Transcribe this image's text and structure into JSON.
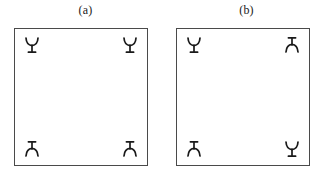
{
  "figure": {
    "background_color": "#ffffff",
    "stroke_color": "#4a4a4a",
    "glyph_color": "#1a1a1a",
    "panel_count": 2
  },
  "panels": [
    {
      "id": "panel-a",
      "label": "(a)",
      "symmetry": "horizontal-mirror",
      "corners": [
        {
          "position": "top-left",
          "glyph": "antenna-icon",
          "orientation": "up"
        },
        {
          "position": "top-right",
          "glyph": "antenna-icon",
          "orientation": "up"
        },
        {
          "position": "bottom-left",
          "glyph": "antenna-icon",
          "orientation": "down"
        },
        {
          "position": "bottom-right",
          "glyph": "antenna-icon",
          "orientation": "down"
        }
      ]
    },
    {
      "id": "panel-b",
      "label": "(b)",
      "symmetry": "diagonal-point",
      "corners": [
        {
          "position": "top-left",
          "glyph": "antenna-icon",
          "orientation": "up"
        },
        {
          "position": "top-right",
          "glyph": "antenna-icon",
          "orientation": "down"
        },
        {
          "position": "bottom-left",
          "glyph": "antenna-icon",
          "orientation": "down"
        },
        {
          "position": "bottom-right",
          "glyph": "antenna-icon",
          "orientation": "up"
        }
      ]
    }
  ]
}
